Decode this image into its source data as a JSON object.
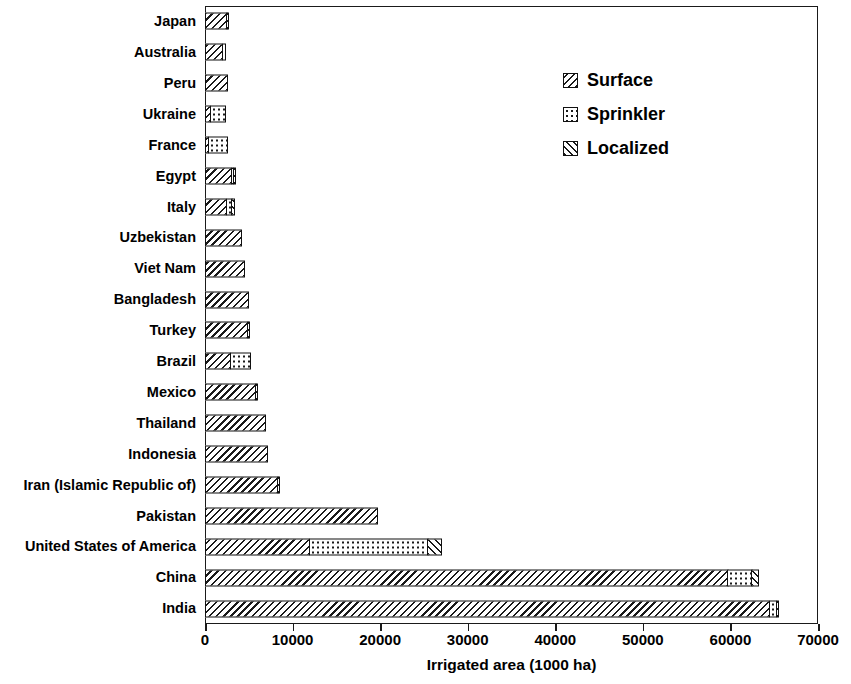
{
  "chart_data": {
    "type": "bar",
    "orientation": "horizontal",
    "stacked": true,
    "title": "",
    "xlabel": "Irrigated area (1000 ha)",
    "ylabel": "",
    "xlim": [
      0,
      70000
    ],
    "xticks": [
      0,
      10000,
      20000,
      30000,
      40000,
      50000,
      60000,
      70000
    ],
    "xticklabels": [
      "0",
      "10000",
      "20000",
      "30000",
      "40000",
      "50000",
      "60000",
      "70000"
    ],
    "grid": false,
    "legend_position": "upper right",
    "categories": [
      "Japan",
      "Australia",
      "Peru",
      "Ukraine",
      "France",
      "Egypt",
      "Italy",
      "Uzbekistan",
      "Viet Nam",
      "Bangladesh",
      "Turkey",
      "Brazil",
      "Mexico",
      "Thailand",
      "Indonesia",
      "Iran (Islamic Republic of)",
      "Pakistan",
      "United States of America",
      "China",
      "India"
    ],
    "series": [
      {
        "name": "Surface",
        "fill": "backslash-hatch",
        "values": [
          2600,
          2100,
          2600,
          700,
          500,
          3100,
          2500,
          4200,
          4600,
          5000,
          5000,
          3000,
          5900,
          7000,
          7200,
          8400,
          19700,
          12000,
          59800,
          64500
        ]
      },
      {
        "name": "Sprinkler",
        "fill": "dots",
        "values": [
          0,
          500,
          0,
          1900,
          2300,
          150,
          800,
          0,
          0,
          0,
          0,
          2400,
          0,
          0,
          0,
          0,
          0,
          13700,
          2900,
          1000
        ]
      },
      {
        "name": "Localized",
        "fill": "forwardslash-hatch",
        "values": [
          200,
          0,
          0,
          0,
          0,
          250,
          400,
          0,
          0,
          0,
          300,
          0,
          250,
          0,
          0,
          200,
          0,
          1700,
          900,
          400
        ]
      }
    ]
  },
  "legend": {
    "items": [
      {
        "label": "Surface",
        "fill": "backslash-hatch"
      },
      {
        "label": "Sprinkler",
        "fill": "dots"
      },
      {
        "label": "Localized",
        "fill": "forwardslash-hatch"
      }
    ]
  }
}
